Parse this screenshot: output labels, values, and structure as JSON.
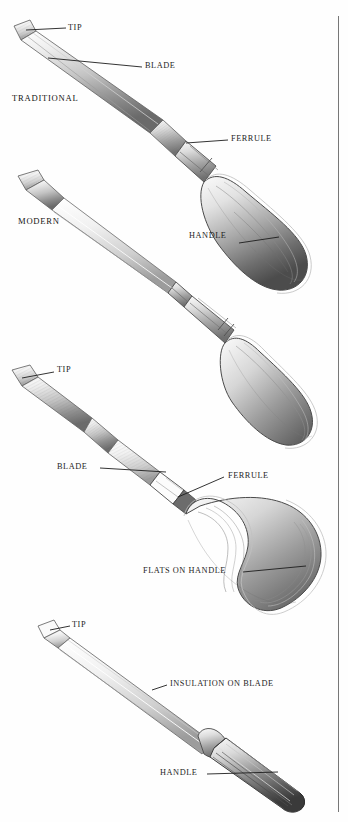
{
  "page": {
    "background_color": "#fefefe",
    "ink_color": "#1d1d1d",
    "rule_color": "#777777"
  },
  "figures": [
    {
      "id": "traditional",
      "category_label": "TRADITIONAL",
      "callouts": [
        {
          "name": "tip",
          "text": "TIP"
        },
        {
          "name": "blade",
          "text": "BLADE"
        },
        {
          "name": "ferrule",
          "text": "FERRULE"
        },
        {
          "name": "handle",
          "text": "HANDLE"
        }
      ]
    },
    {
      "id": "modern",
      "category_label": "MODERN",
      "callouts": []
    },
    {
      "id": "flat-handle",
      "category_label": "",
      "callouts": [
        {
          "name": "tip",
          "text": "TIP"
        },
        {
          "name": "blade",
          "text": "BLADE"
        },
        {
          "name": "ferrule",
          "text": "FERRULE"
        },
        {
          "name": "flats-on-handle",
          "text": "FLATS ON HANDLE"
        }
      ]
    },
    {
      "id": "insulated",
      "category_label": "",
      "callouts": [
        {
          "name": "tip",
          "text": "TIP"
        },
        {
          "name": "insulation-on-blade",
          "text": "INSULATION ON BLADE"
        },
        {
          "name": "handle",
          "text": "HANDLE"
        }
      ]
    }
  ]
}
